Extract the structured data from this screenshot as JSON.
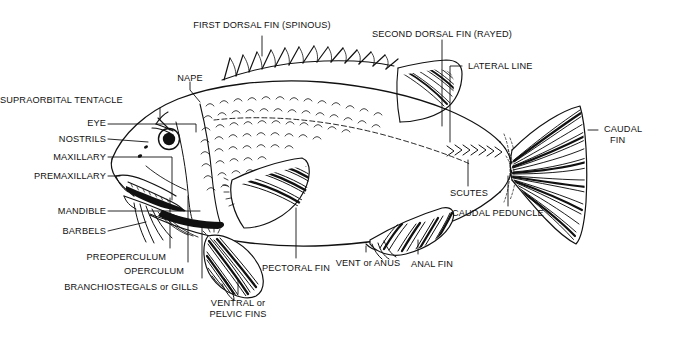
{
  "diagram": {
    "background_color": "#ffffff",
    "ink_color": "#111111"
  },
  "labels": {
    "first_dorsal_fin": "FIRST DORSAL FIN (SPINOUS)",
    "second_dorsal_fin": "SECOND DORSAL FIN (RAYED)",
    "lateral_line": "LATERAL LINE",
    "nape": "NAPE",
    "supraorbital_tentacle": "SUPRAORBITAL TENTACLE",
    "eye": "EYE",
    "nostrils": "NOSTRILS",
    "maxillary": "MAXILLARY",
    "premaxillary": "PREMAXILLARY",
    "mandible": "MANDIBLE",
    "barbels": "BARBELS",
    "preoperculum": "PREOPERCULUM",
    "operculum": "OPERCULUM",
    "branchiostegals": "BRANCHIOSTEGALS or GILLS",
    "ventral_pelvic_line1": "VENTRAL or",
    "ventral_pelvic_line2": "PELVIC FINS",
    "pectoral_fin": "PECTORAL FIN",
    "vent_anus": "VENT or ANUS",
    "anal_fin": "ANAL FIN",
    "scutes": "SCUTES",
    "caudal_peduncle": "CAUDAL PEDUNCLE",
    "caudal_fin_line1": "CAUDAL",
    "caudal_fin_line2": "FIN"
  },
  "parts": [
    {
      "key": "first_dorsal_fin",
      "name": "first-dorsal-fin",
      "description": "spiny dorsal fin along upper back"
    },
    {
      "key": "second_dorsal_fin",
      "name": "second-dorsal-fin",
      "description": "rayed soft dorsal fin"
    },
    {
      "key": "lateral_line",
      "name": "lateral-line",
      "description": "sensory line along body side"
    },
    {
      "key": "nape",
      "name": "nape",
      "description": "region behind the head"
    },
    {
      "key": "supraorbital_tentacle",
      "name": "supraorbital-tentacle",
      "description": "tentacle above the eye"
    },
    {
      "key": "eye",
      "name": "eye",
      "description": "round eye with dark pupil"
    },
    {
      "key": "nostrils",
      "name": "nostrils",
      "description": "paired nares on snout"
    },
    {
      "key": "maxillary",
      "name": "maxillary",
      "description": "upper jaw bone"
    },
    {
      "key": "premaxillary",
      "name": "premaxillary",
      "description": "front upper jaw bone"
    },
    {
      "key": "mandible",
      "name": "mandible",
      "description": "lower jaw"
    },
    {
      "key": "barbels",
      "name": "barbels",
      "description": "whisker-like sensory appendages"
    },
    {
      "key": "preoperculum",
      "name": "preoperculum",
      "description": "bone in front of gill cover"
    },
    {
      "key": "operculum",
      "name": "operculum",
      "description": "gill cover"
    },
    {
      "key": "branchiostegals",
      "name": "branchiostegals-or-gills",
      "description": "branchiostegal rays / gills"
    },
    {
      "key": "ventral_pelvic",
      "name": "ventral-or-pelvic-fins",
      "description": "paired pelvic fins"
    },
    {
      "key": "pectoral_fin",
      "name": "pectoral-fin",
      "description": "paired pectoral fin behind gill cover"
    },
    {
      "key": "vent_anus",
      "name": "vent-or-anus",
      "description": "vent opening before anal fin"
    },
    {
      "key": "anal_fin",
      "name": "anal-fin",
      "description": "fin on ventral side behind vent"
    },
    {
      "key": "scutes",
      "name": "scutes",
      "description": "chevron bony plates along caudal peduncle"
    },
    {
      "key": "caudal_peduncle",
      "name": "caudal-peduncle",
      "description": "narrow stalk before tail fin"
    },
    {
      "key": "caudal_fin",
      "name": "caudal-fin",
      "description": "tail fin"
    }
  ]
}
